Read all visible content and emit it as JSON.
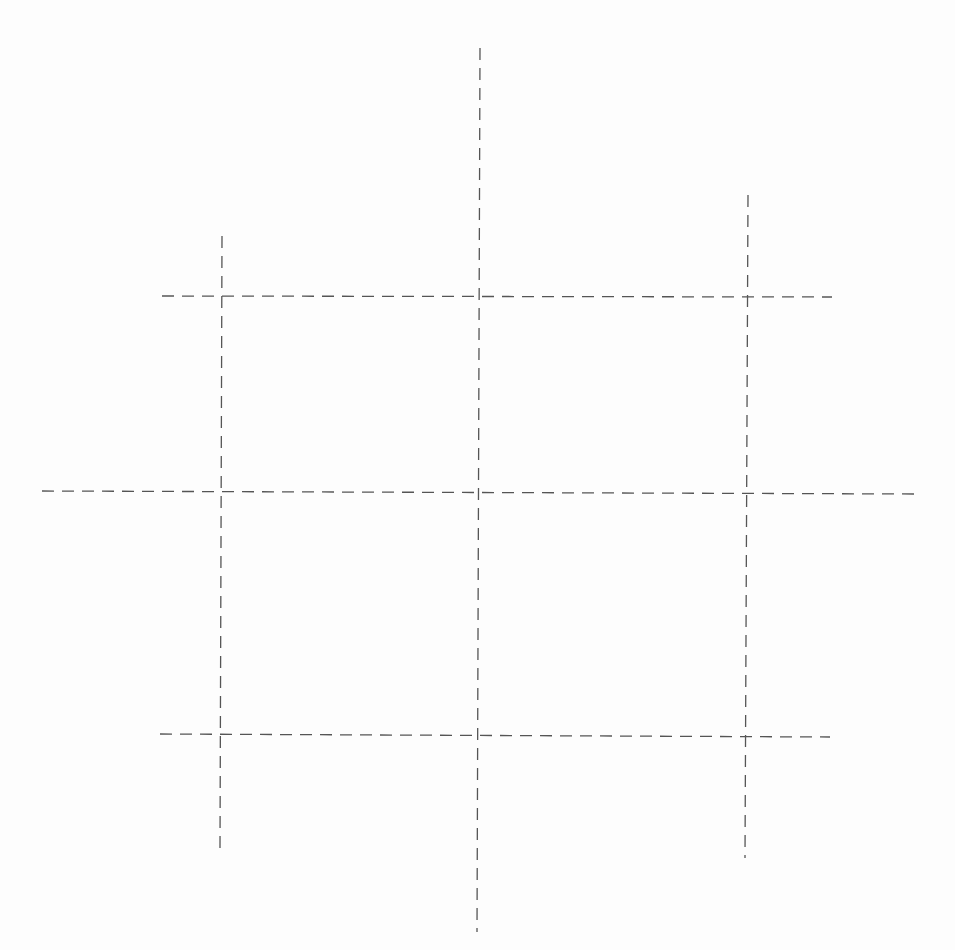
{
  "diagram": {
    "type": "dashed-grid",
    "canvas": {
      "width": 955,
      "height": 950,
      "background": "#fdfdfd"
    },
    "style": {
      "stroke": "#555555",
      "stroke_width": 1.3,
      "dash": "12 8"
    },
    "lines": [
      {
        "id": "vertical-left",
        "x1": 222,
        "y1": 236,
        "x2": 220,
        "y2": 848
      },
      {
        "id": "vertical-center",
        "x1": 480,
        "y1": 48,
        "x2": 477,
        "y2": 932
      },
      {
        "id": "vertical-right",
        "x1": 748,
        "y1": 195,
        "x2": 745,
        "y2": 858
      },
      {
        "id": "horizontal-top",
        "x1": 162,
        "y1": 296,
        "x2": 832,
        "y2": 297
      },
      {
        "id": "horizontal-middle",
        "x1": 42,
        "y1": 491,
        "x2": 918,
        "y2": 494
      },
      {
        "id": "horizontal-bottom",
        "x1": 160,
        "y1": 734,
        "x2": 830,
        "y2": 737
      }
    ]
  }
}
